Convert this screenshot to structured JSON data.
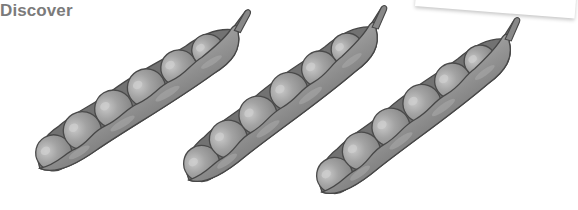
{
  "header": {
    "title": "Discover"
  },
  "illustration": {
    "subject": "pea pods",
    "pod_count": 3,
    "peas_per_pod": 6,
    "colors": {
      "pod_fill": "#8f8f8f",
      "pod_light": "#a7a7a7",
      "pod_inner": "#6e6e6e",
      "outline": "#4a4a4a",
      "pea_fill": "#9c9c9c",
      "pea_highlight": "#c4c4c4"
    }
  },
  "decor": {
    "card_shadow": "top-right card edge"
  }
}
